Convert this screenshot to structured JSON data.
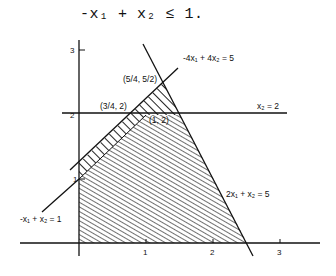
{
  "header": {
    "equation": "-x₁ + x₂ ≤ 1."
  },
  "axes": {
    "x_ticks": [
      "1",
      "2",
      "3"
    ],
    "y_ticks": [
      "1",
      "2",
      "3"
    ]
  },
  "lines": {
    "l1": "-4x₁ + 4x₂ = 5",
    "l2": "x₂ = 2",
    "l3": "2x₁ + x₂ = 5",
    "l4": "-x₁ + x₂ = 1"
  },
  "points": {
    "p1": "(5/4, 5/2)",
    "p2": "(3/4, 2)",
    "p3": "(1, 2)"
  }
}
